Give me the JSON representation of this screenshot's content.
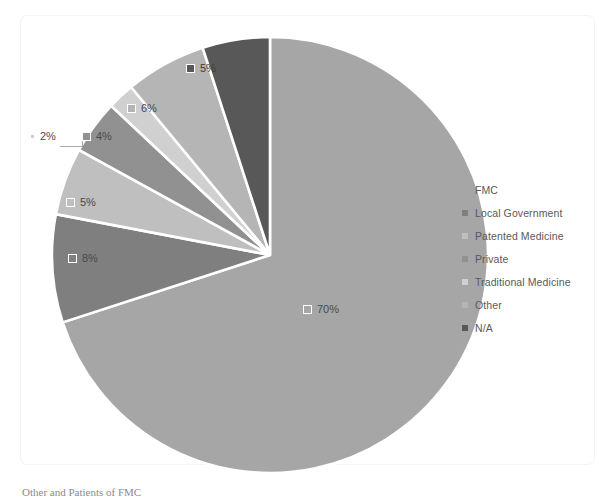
{
  "chart_data": {
    "type": "pie",
    "title": "",
    "categories": [
      "FMC",
      "Local Government",
      "Patented Medicine",
      "Private",
      "Traditional Medicine",
      "Other",
      "N/A"
    ],
    "values": [
      70,
      8,
      5,
      4,
      2,
      6,
      5
    ],
    "labels": [
      "70%",
      "8%",
      "5%",
      "4%",
      "2%",
      "6%",
      "5%"
    ],
    "colors": [
      "#a6a6a6",
      "#7f7f7f",
      "#bfbfbf",
      "#919191",
      "#d0d0d0",
      "#b5b5b5",
      "#585858"
    ],
    "legend_position": "right",
    "start_angle_deg": 0,
    "direction": "clockwise",
    "grid": false,
    "data_labels": true,
    "leader_lines": [
      "2%"
    ]
  },
  "legend": {
    "items": [
      {
        "label": "FMC",
        "color": "#a6a6a6"
      },
      {
        "label": "Local Government",
        "color": "#7f7f7f"
      },
      {
        "label": "Patented Medicine",
        "color": "#bfbfbf"
      },
      {
        "label": "Private",
        "color": "#919191"
      },
      {
        "label": "Traditional Medicine",
        "color": "#d0d0d0"
      },
      {
        "label": "Other",
        "color": "#b5b5b5"
      },
      {
        "label": "N/A",
        "color": "#585858"
      }
    ]
  },
  "slice_labels": {
    "fmc": "70%",
    "local_government": "8%",
    "patented_medicine": "5%",
    "private": "4%",
    "traditional_medicine": "2%",
    "other": "6%",
    "na": "5%"
  },
  "caption": {
    "text": "Other and Patients of FMC"
  }
}
